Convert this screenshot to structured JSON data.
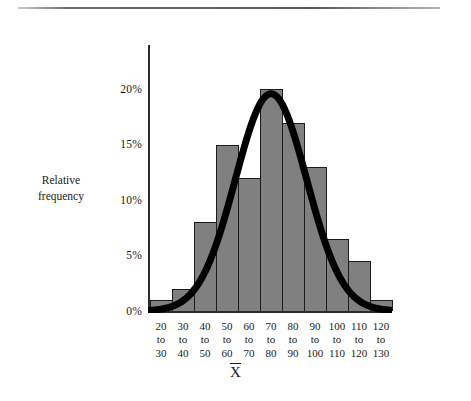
{
  "figure": {
    "has_top_rule": true,
    "background": "#ffffff",
    "bar_fill": "#808080",
    "bar_stroke": "#1c1c1c",
    "axis_color": "#2b2b2b",
    "curve_color": "#000000"
  },
  "chart_data": {
    "type": "bar",
    "title": "",
    "subtitle": "",
    "xlabel": "X̄",
    "ylabel": "Relative frequency",
    "categories": [
      "20 to 30",
      "30 to 40",
      "40 to 50",
      "50 to 60",
      "60 to 70",
      "70 to 80",
      "80 to 90",
      "90 to 100",
      "100 to 110",
      "110 to 120",
      "120 to 130"
    ],
    "category_lines": [
      [
        "20",
        "to",
        "30"
      ],
      [
        "30",
        "to",
        "40"
      ],
      [
        "40",
        "to",
        "50"
      ],
      [
        "50",
        "to",
        "60"
      ],
      [
        "60",
        "to",
        "70"
      ],
      [
        "70",
        "to",
        "80"
      ],
      [
        "80",
        "to",
        "90"
      ],
      [
        "90",
        "to",
        "100"
      ],
      [
        "100",
        "to",
        "110"
      ],
      [
        "110",
        "to",
        "120"
      ],
      [
        "120",
        "to",
        "130"
      ]
    ],
    "values": [
      1,
      2,
      8,
      15,
      12,
      20,
      17,
      13,
      6.5,
      4.5,
      1
    ],
    "value_unit": "%",
    "ylim": [
      0,
      24
    ],
    "yticks": [
      0,
      5,
      10,
      15,
      20
    ],
    "ytick_labels": [
      "0%",
      "5%",
      "10%",
      "15%",
      "20%"
    ],
    "grid": false,
    "legend": null,
    "overlay": {
      "type": "line",
      "name": "normal-curve",
      "description": "smooth bell-shaped normal curve overlaid on the histogram, peaking at the 70 to 80 bin near 20%"
    }
  },
  "axis": {
    "y_title_line1": "Relative",
    "y_title_line2": "frequency",
    "x_title": "X̄"
  }
}
